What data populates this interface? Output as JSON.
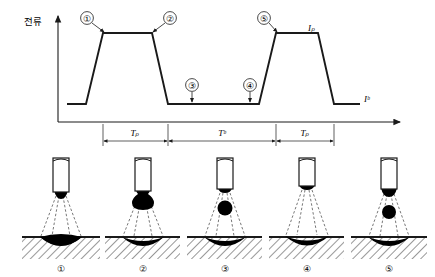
{
  "figure": {
    "kind": "pulsed-gmaw-waveform-and-droplet-transfer"
  },
  "waveform": {
    "y_axis_label": "전류",
    "peak_current_label": "Iₚ",
    "base_current_label": "Iᵇ",
    "callouts": [
      {
        "id": "c1",
        "label": "①"
      },
      {
        "id": "c2",
        "label": "②"
      },
      {
        "id": "c3",
        "label": "③"
      },
      {
        "id": "c4",
        "label": "④"
      },
      {
        "id": "c5",
        "label": "⑤"
      }
    ],
    "timing": [
      {
        "id": "t1",
        "label": "Tₚ"
      },
      {
        "id": "t2",
        "label": "Tᵇ"
      },
      {
        "id": "t3",
        "label": "Tₚ"
      }
    ]
  },
  "stages": [
    {
      "num": "①",
      "state": "molten tip forming at electrode end"
    },
    {
      "num": "②",
      "state": "droplet grown large at electrode tip"
    },
    {
      "num": "③",
      "state": "droplet detached, in free flight"
    },
    {
      "num": "④",
      "state": "droplet merged into weld pool"
    },
    {
      "num": "⑤",
      "state": "new droplet forming, previous in flight"
    }
  ],
  "colors": {
    "line": "#1a1a1a",
    "fill": "#000000",
    "hatch": "#1a1a1a",
    "dash": "#555555"
  }
}
